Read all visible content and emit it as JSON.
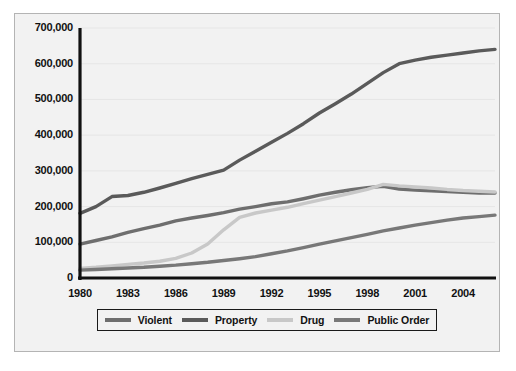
{
  "figure": {
    "background_color": "#f2f2f2",
    "border_color": "#b4b4b4",
    "axis_color": "#111111"
  },
  "chart_data": {
    "type": "line",
    "title": "",
    "subtitle": "",
    "xlabel": "",
    "ylabel": "",
    "grid": false,
    "legend_position": "bottom",
    "xlim": [
      1980,
      2006
    ],
    "ylim": [
      0,
      700000
    ],
    "x": [
      1980,
      1981,
      1982,
      1983,
      1984,
      1985,
      1986,
      1987,
      1988,
      1989,
      1990,
      1991,
      1992,
      1993,
      1994,
      1995,
      1996,
      1997,
      1998,
      1999,
      2000,
      2001,
      2002,
      2003,
      2004,
      2005,
      2006
    ],
    "xticks": [
      1980,
      1983,
      1986,
      1989,
      1992,
      1995,
      1998,
      2001,
      2004
    ],
    "xtick_labels": [
      "1980",
      "1983",
      "1986",
      "1989",
      "1992",
      "1995",
      "1998",
      "2001",
      "2004"
    ],
    "yticks": [
      0,
      100000,
      200000,
      300000,
      400000,
      500000,
      600000,
      700000
    ],
    "ytick_labels": [
      "0",
      "100,000",
      "200,000",
      "300,000",
      "400,000",
      "500,000",
      "600,000",
      "700,000"
    ],
    "series": [
      {
        "name": "Violent",
        "color": "#6e6e6e",
        "values": [
          95000,
          105000,
          115000,
          128000,
          138000,
          148000,
          160000,
          168000,
          175000,
          183000,
          193000,
          200000,
          208000,
          213000,
          222000,
          232000,
          240000,
          247000,
          253000,
          257000,
          249000,
          246000,
          244000,
          242000,
          240000,
          238000,
          238000
        ]
      },
      {
        "name": "Property",
        "color": "#5a5a5a",
        "values": [
          181000,
          200000,
          228000,
          231000,
          240000,
          252000,
          265000,
          278000,
          290000,
          302000,
          330000,
          355000,
          380000,
          405000,
          432000,
          462000,
          488000,
          515000,
          545000,
          575000,
          600000,
          610000,
          618000,
          624000,
          630000,
          636000,
          640000
        ]
      },
      {
        "name": "Drug",
        "color": "#c8c8c8",
        "values": [
          27000,
          30000,
          34000,
          38000,
          42000,
          47000,
          55000,
          70000,
          95000,
          135000,
          170000,
          182000,
          190000,
          198000,
          208000,
          218000,
          228000,
          238000,
          248000,
          262000,
          258000,
          255000,
          252000,
          248000,
          245000,
          243000,
          241000
        ]
      },
      {
        "name": "Public Order",
        "color": "#787878",
        "values": [
          22000,
          24000,
          26000,
          28000,
          30000,
          33000,
          36000,
          40000,
          44000,
          49000,
          54000,
          60000,
          68000,
          76000,
          85000,
          95000,
          104000,
          113000,
          122000,
          132000,
          140000,
          148000,
          155000,
          162000,
          168000,
          172000,
          176000
        ]
      }
    ]
  },
  "legend": {
    "items": [
      {
        "label": "Violent",
        "color": "#6e6e6e"
      },
      {
        "label": "Property",
        "color": "#5a5a5a"
      },
      {
        "label": "Drug",
        "color": "#c8c8c8"
      },
      {
        "label": "Public Order",
        "color": "#787878"
      }
    ]
  }
}
